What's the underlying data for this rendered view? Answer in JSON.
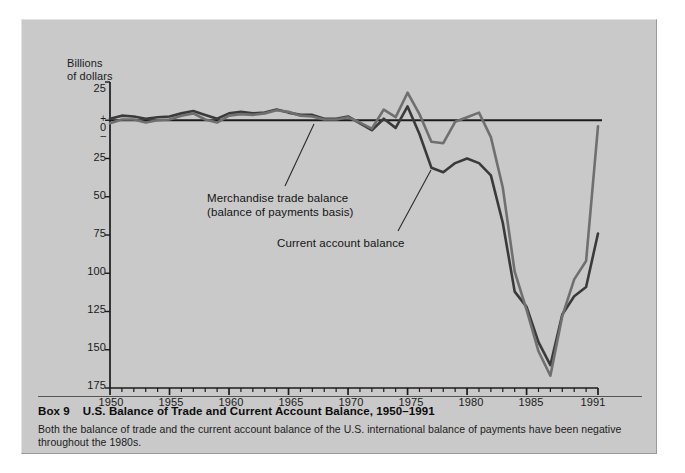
{
  "figure": {
    "caption_box_number": "Box 9",
    "caption_title": "U.S. Balance of Trade and Current Account Balance, 1950–1991",
    "caption_body": "Both the balance of trade and the current account balance of the U.S. international balance of payments have been negative throughout the 1980s.",
    "panel_color": "#c9c9c9",
    "page_color": "#ffffff"
  },
  "chart_data": {
    "type": "line",
    "title": "U.S. Balance of Trade and Current Account Balance, 1950–1991",
    "subtitle": "",
    "xlabel": "",
    "ylabel": "Billions of dollars",
    "ylabel_lines": [
      "Billions",
      "of dollars"
    ],
    "grid": false,
    "legend_position": "inline-annotations",
    "axis_color": "#1b1b1b",
    "zero_line_color": "#1b1b1b",
    "xlim": [
      1950,
      1991
    ],
    "ylim": [
      -175,
      25
    ],
    "y_tick_values": [
      25,
      0,
      -25,
      -50,
      -75,
      -100,
      -125,
      -150,
      -175
    ],
    "y_tick_labels": [
      "25",
      "0",
      "25",
      "50",
      "75",
      "100",
      "125",
      "150",
      "175"
    ],
    "y_zero_sign_above": "+",
    "y_zero_sign_below": "–",
    "y_axis_note": "Values below zero are plotted downward; tick labels are unsigned magnitudes in billions of dollars.",
    "x_tick_values": [
      1950,
      1955,
      1960,
      1965,
      1970,
      1975,
      1980,
      1985,
      1991
    ],
    "x_tick_labels": [
      "1950",
      "1955",
      "1960",
      "1965",
      "1970",
      "1975",
      "1980",
      "1985",
      "1991"
    ],
    "x_minor_tick_interval": 1,
    "annotations": [
      {
        "name": "merchandise-trade-balance-label",
        "text_lines": [
          "Merchandise trade balance",
          "(balance of payments basis)"
        ],
        "text": "Merchandise trade balance (balance of payments basis)",
        "points_to_year": 1979,
        "points_to_value": -10
      },
      {
        "name": "current-account-balance-label",
        "text_lines": [
          "Current account balance"
        ],
        "text": "Current account balance",
        "points_to_year": 1982,
        "points_to_value": -30
      }
    ],
    "series": [
      {
        "name": "Merchandise trade balance",
        "color": "#3a3a3a",
        "width": 2.6,
        "x": [
          1950,
          1951,
          1952,
          1953,
          1954,
          1955,
          1956,
          1957,
          1958,
          1959,
          1960,
          1961,
          1962,
          1963,
          1964,
          1965,
          1966,
          1967,
          1968,
          1969,
          1970,
          1971,
          1972,
          1973,
          1974,
          1975,
          1976,
          1977,
          1978,
          1979,
          1980,
          1981,
          1982,
          1983,
          1984,
          1985,
          1986,
          1987,
          1988,
          1989,
          1990,
          1991
        ],
        "values": [
          1,
          3,
          2.5,
          1,
          2,
          2.5,
          4.5,
          6,
          3.5,
          1,
          4.5,
          5.5,
          4.5,
          5,
          7,
          5,
          3.5,
          3.5,
          1,
          1,
          2.5,
          -2,
          -6.5,
          1,
          -5,
          9,
          -9,
          -31,
          -34,
          -28,
          -25,
          -28,
          -36,
          -67,
          -112,
          -122,
          -145,
          -160,
          -127,
          -115,
          -109,
          -74
        ]
      },
      {
        "name": "Current account balance",
        "color": "#6f6f6f",
        "width": 2.6,
        "x": [
          1950,
          1951,
          1952,
          1953,
          1954,
          1955,
          1956,
          1957,
          1958,
          1959,
          1960,
          1961,
          1962,
          1963,
          1964,
          1965,
          1966,
          1967,
          1968,
          1969,
          1970,
          1971,
          1972,
          1973,
          1974,
          1975,
          1976,
          1977,
          1978,
          1979,
          1980,
          1981,
          1982,
          1983,
          1984,
          1985,
          1986,
          1987,
          1988,
          1989,
          1990,
          1991
        ],
        "values": [
          -2,
          0.5,
          0.5,
          -1.5,
          0,
          0.5,
          3,
          4.5,
          0.5,
          -1.5,
          3,
          4,
          3.5,
          4.5,
          6.5,
          5.5,
          3,
          2.5,
          0.5,
          0.5,
          2,
          -1.5,
          -5.5,
          7,
          2,
          18,
          4,
          -14,
          -15,
          -1,
          2,
          5,
          -11,
          -44,
          -99,
          -124,
          -151,
          -167,
          -128,
          -104,
          -92,
          -4
        ]
      }
    ]
  }
}
